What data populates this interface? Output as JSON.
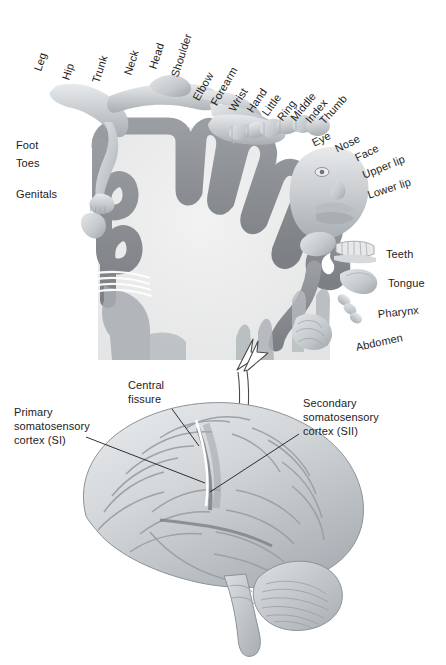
{
  "figure": {
    "background_color": "#ffffff",
    "width": 446,
    "height": 665
  },
  "colors": {
    "cortex_ribbon": "#8e9296",
    "cortex_interior": "#ececec",
    "body_flesh": "#c9cdd0",
    "brain_base": "#cfd3d6",
    "brain_shadow": "#9aa0a4",
    "label_text": "#1c1c1c",
    "leader_line": "#1c1c1c",
    "arrow_outline": "#4a4a4a"
  },
  "top_panel": {
    "name": "sensory-homunculus-cross-section",
    "description": "Coronal cross-section of primary somatosensory cortex with body-part homunculus draped over the cortical ribbon",
    "top_labels": [
      {
        "text": "Leg",
        "x": 38,
        "y": 64,
        "rotation": -72
      },
      {
        "text": "Hip",
        "x": 66,
        "y": 73,
        "rotation": -72
      },
      {
        "text": "Trunk",
        "x": 96,
        "y": 76,
        "rotation": -72
      },
      {
        "text": "Neck",
        "x": 128,
        "y": 68,
        "rotation": -72
      },
      {
        "text": "Head",
        "x": 153,
        "y": 62,
        "rotation": -72
      },
      {
        "text": "Shoulder",
        "x": 175,
        "y": 70,
        "rotation": -72
      },
      {
        "text": "Elbow",
        "x": 196,
        "y": 93,
        "rotation": -60
      },
      {
        "text": "Forearm",
        "x": 214,
        "y": 98,
        "rotation": -60
      },
      {
        "text": "Wrist",
        "x": 232,
        "y": 104,
        "rotation": -58
      },
      {
        "text": "Hand",
        "x": 250,
        "y": 105,
        "rotation": -56
      },
      {
        "text": "Little",
        "x": 265,
        "y": 108,
        "rotation": -54
      },
      {
        "text": "Ring",
        "x": 280,
        "y": 113,
        "rotation": -52
      },
      {
        "text": "Middle",
        "x": 293,
        "y": 113,
        "rotation": -50
      },
      {
        "text": "Index",
        "x": 308,
        "y": 115,
        "rotation": -50
      },
      {
        "text": "Thumb",
        "x": 322,
        "y": 116,
        "rotation": -48
      }
    ],
    "left_labels": [
      {
        "text": "Foot",
        "x": 16,
        "y": 139
      },
      {
        "text": "Toes",
        "x": 16,
        "y": 157
      },
      {
        "text": "Genitals",
        "x": 16,
        "y": 188
      }
    ],
    "right_labels": [
      {
        "text": "Eye",
        "x": 313,
        "y": 137,
        "rotation": -26
      },
      {
        "text": "Nose",
        "x": 336,
        "y": 143,
        "rotation": -26
      },
      {
        "text": "Face",
        "x": 356,
        "y": 152,
        "rotation": -26
      },
      {
        "text": "Upper lip",
        "x": 363,
        "y": 169,
        "rotation": -22
      },
      {
        "text": "Lower lip",
        "x": 368,
        "y": 189,
        "rotation": -18
      },
      {
        "text": "Teeth",
        "x": 386,
        "y": 254,
        "rotation": 0
      },
      {
        "text": "Tongue",
        "x": 391,
        "y": 283,
        "rotation": 0
      },
      {
        "text": "Pharynx",
        "x": 381,
        "y": 312,
        "rotation": -6
      },
      {
        "text": "Abdomen",
        "x": 360,
        "y": 345,
        "rotation": -12
      }
    ]
  },
  "connector": {
    "name": "expansion-arrow",
    "description": "Hollow white arrow pointing up from the brain to the cross-section",
    "direction": "up"
  },
  "bottom_panel": {
    "name": "lateral-brain-view",
    "description": "Lateral view of the left cerebral hemisphere with cerebellum and brainstem",
    "annotations": [
      {
        "name": "primary-somatosensory-cortex",
        "lines": [
          "Primary",
          "somatosensory",
          "cortex (SI)"
        ],
        "x": 14,
        "y": 411,
        "leader": {
          "x1": 86,
          "y1": 437,
          "x2": 205,
          "y2": 483
        }
      },
      {
        "name": "central-fissure",
        "lines": [
          "Central",
          "fissure"
        ],
        "x": 128,
        "y": 383,
        "leader": {
          "x1": 172,
          "y1": 409,
          "x2": 199,
          "y2": 446
        }
      },
      {
        "name": "secondary-somatosensory-cortex",
        "lines": [
          "Secondary",
          "somatosensory",
          "cortex (SII)"
        ],
        "x": 303,
        "y": 401,
        "leader": {
          "x1": 299,
          "y1": 434,
          "x2": 210,
          "y2": 492
        }
      }
    ]
  }
}
